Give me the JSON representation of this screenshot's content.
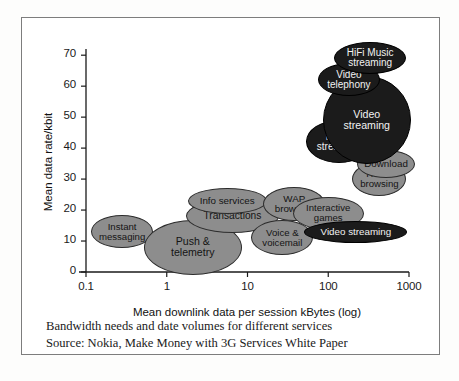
{
  "figure": {
    "caption_line1": "Bandwidth needs and date volumes for different services",
    "caption_line2": "Source: Nokia, Make Money with 3G Services White Paper"
  },
  "chart_data": {
    "type": "scatter",
    "title": "",
    "xlabel": "Mean downlink data per session kBytes (log)",
    "ylabel": "Mean data rate/kbit",
    "xscale": "log",
    "xlim": [
      0.1,
      1000
    ],
    "ylim": [
      0,
      72
    ],
    "xticks": [
      "0.1",
      "1",
      "10",
      "100",
      "1000"
    ],
    "xtick_values": [
      0.1,
      1,
      10,
      100,
      1000
    ],
    "yticks": [
      "0",
      "10",
      "20",
      "30",
      "40",
      "50",
      "60",
      "70"
    ],
    "ytick_values": [
      0,
      10,
      20,
      30,
      40,
      50,
      60,
      70
    ],
    "grid": false,
    "legend": "none",
    "bubbles": [
      {
        "label": "Instant messaging",
        "label_line1": "Instant",
        "label_line2": "messaging",
        "x": 0.28,
        "y": 13,
        "w_px": 62,
        "h_px": 33,
        "shade": "light",
        "font_px": 9.6
      },
      {
        "label": "Push & telemetry",
        "label_line1": "Push &",
        "label_line2": "telemetry",
        "x": 2.1,
        "y": 8,
        "w_px": 98,
        "h_px": 55,
        "shade": "light",
        "font_px": 10.6
      },
      {
        "label": "Transactions",
        "label_line1": "Transactions",
        "label_line2": "",
        "x": 6.5,
        "y": 18,
        "w_px": 93,
        "h_px": 34,
        "shade": "light",
        "font_px": 10.2
      },
      {
        "label": "Info services",
        "label_line1": "Info services",
        "label_line2": "",
        "x": 5.6,
        "y": 23,
        "w_px": 79,
        "h_px": 26,
        "shade": "light",
        "font_px": 9.8
      },
      {
        "label": "Voice & voicemail",
        "label_line1": "Voice &",
        "label_line2": "voicemail",
        "x": 27,
        "y": 11,
        "w_px": 62,
        "h_px": 35,
        "shade": "light",
        "font_px": 9.6
      },
      {
        "label": "WAP browsing",
        "label_line1": "WAP",
        "label_line2": "browsing",
        "x": 38,
        "y": 22,
        "w_px": 62,
        "h_px": 34,
        "shade": "light",
        "font_px": 9.8
      },
      {
        "label": "Interactive games",
        "label_line1": "Interactive",
        "label_line2": "games",
        "x": 100,
        "y": 19,
        "w_px": 71,
        "h_px": 33,
        "shade": "light",
        "font_px": 9.6
      },
      {
        "label": "Video streaming",
        "label_line1": "Video streaming",
        "label_line2": "",
        "x": 220,
        "y": 13,
        "w_px": 103,
        "h_px": 22,
        "shade": "dark",
        "font_px": 9.8
      },
      {
        "label": "HTML browsing",
        "label_line1": "HTML",
        "label_line2": "browsing",
        "x": 430,
        "y": 30,
        "w_px": 54,
        "h_px": 34,
        "shade": "light",
        "font_px": 9.6
      },
      {
        "label": "Download",
        "label_line1": "Download",
        "label_line2": "",
        "x": 520,
        "y": 35,
        "w_px": 58,
        "h_px": 28,
        "shade": "light",
        "font_px": 9.8
      },
      {
        "label": "Music streaming",
        "label_line1": "Music",
        "label_line2": "streaming",
        "x": 135,
        "y": 42,
        "w_px": 66,
        "h_px": 43,
        "shade": "dark",
        "font_px": 10.0
      },
      {
        "label": "Video streaming",
        "label_line1": "Video",
        "label_line2": "streaming",
        "x": 300,
        "y": 49,
        "w_px": 88,
        "h_px": 88,
        "shade": "dark",
        "font_px": 10.6
      },
      {
        "label": "Video telephony",
        "label_line1": "Video",
        "label_line2": "telephony",
        "x": 180,
        "y": 62,
        "w_px": 62,
        "h_px": 33,
        "shade": "dark",
        "font_px": 10.0
      },
      {
        "label": "HiFi Music streaming",
        "label_line1": "HiFi Music",
        "label_line2": "streaming",
        "x": 330,
        "y": 69,
        "w_px": 72,
        "h_px": 32,
        "shade": "dark",
        "font_px": 10.0
      }
    ]
  }
}
